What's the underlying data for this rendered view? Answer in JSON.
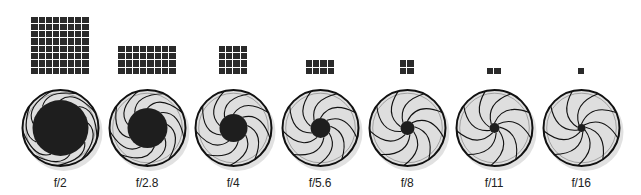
{
  "diagram": {
    "colors": {
      "cell": "#2a2a2a",
      "iris_fill": "#dedede",
      "rim": "#111111",
      "hole": "#1e1e1e",
      "shadow": "#c8c8c8",
      "label": "#222222"
    },
    "outer_radius": 38,
    "blade_count": 9,
    "grid_bottom_y": 74,
    "stops": [
      {
        "label": "f/2",
        "grid_cols": 8,
        "grid_rows": 8,
        "hole_radius": 28,
        "center_x": 60
      },
      {
        "label": "f/2.8",
        "grid_cols": 8,
        "grid_rows": 4,
        "hole_radius": 20,
        "center_x": 147
      },
      {
        "label": "f/4",
        "grid_cols": 4,
        "grid_rows": 4,
        "hole_radius": 14,
        "center_x": 233
      },
      {
        "label": "f/5.6",
        "grid_cols": 4,
        "grid_rows": 2,
        "hole_radius": 10,
        "center_x": 320
      },
      {
        "label": "f/8",
        "grid_cols": 2,
        "grid_rows": 2,
        "hole_radius": 7,
        "center_x": 407
      },
      {
        "label": "f/11",
        "grid_cols": 2,
        "grid_rows": 1,
        "hole_radius": 5,
        "center_x": 494
      },
      {
        "label": "f/16",
        "grid_cols": 1,
        "grid_rows": 1,
        "hole_radius": 4,
        "center_x": 581
      }
    ]
  }
}
